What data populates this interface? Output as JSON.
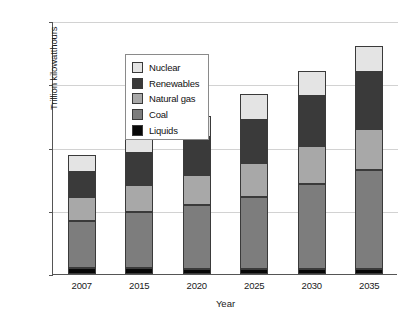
{
  "chart_data": {
    "type": "bar",
    "stacked": true,
    "title": "",
    "xlabel": "Year",
    "ylabel": "Trillion kilowatthours",
    "categories": [
      "2007",
      "2015",
      "2020",
      "2025",
      "2030",
      "2035"
    ],
    "ylim": [
      0,
      40
    ],
    "yticks": [
      0,
      10,
      20,
      30,
      40
    ],
    "ytick_labels": [
      "0",
      "10",
      "20",
      "30",
      "40"
    ],
    "grid": true,
    "legend_position": "upper left",
    "series": [
      {
        "name": "Liquids",
        "color": "#080808",
        "values": [
          0.9,
          0.9,
          0.8,
          0.8,
          0.8,
          0.8
        ]
      },
      {
        "name": "Coal",
        "color": "#7d7d7d",
        "values": [
          7.5,
          8.9,
          10.1,
          11.3,
          13.5,
          15.7
        ]
      },
      {
        "name": "Natural gas",
        "color": "#a8a8a8",
        "values": [
          3.8,
          4.3,
          4.8,
          5.4,
          5.9,
          6.5
        ]
      },
      {
        "name": "Renewables",
        "color": "#3a3a3a",
        "values": [
          3.9,
          5.0,
          6.0,
          6.8,
          7.9,
          8.9
        ]
      },
      {
        "name": "Nuclear",
        "color": "#e4e4e4",
        "values": [
          2.7,
          2.8,
          3.3,
          4.2,
          4.0,
          4.2
        ]
      }
    ],
    "totals": [
      18.8,
      21.9,
      25.0,
      28.5,
      32.1,
      36.1
    ]
  },
  "legend": {
    "items": [
      {
        "label": "Nuclear",
        "color": "#e4e4e4"
      },
      {
        "label": "Renewables",
        "color": "#3a3a3a"
      },
      {
        "label": "Natural gas",
        "color": "#a8a8a8"
      },
      {
        "label": "Coal",
        "color": "#7d7d7d"
      },
      {
        "label": "Liquids",
        "color": "#080808"
      }
    ]
  }
}
